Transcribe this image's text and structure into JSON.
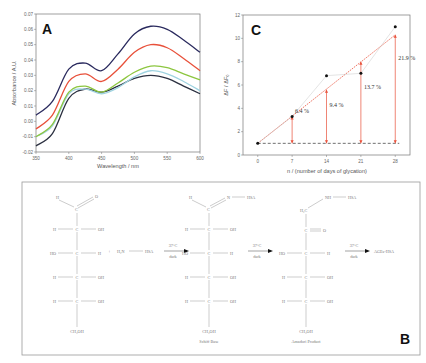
{
  "figure": {
    "panels": [
      "A",
      "B",
      "C"
    ]
  },
  "chart_data": [
    {
      "panel": "A",
      "type": "line",
      "title": "",
      "xlabel": "Wavelength / nm",
      "ylabel": "Absorbance / A.U.",
      "xlim": [
        350,
        600
      ],
      "ylim": [
        -0.02,
        0.07
      ],
      "xticks": [
        "350",
        "400",
        "450",
        "500",
        "550",
        "600"
      ],
      "yticks": [
        "-0.02",
        "-0.01",
        "0.00",
        "0.01",
        "0.02",
        "0.03",
        "0.04",
        "0.05",
        "0.06",
        "0.07"
      ],
      "grid": false,
      "legend": null,
      "x": [
        350,
        375,
        400,
        425,
        450,
        475,
        500,
        525,
        550,
        575,
        600
      ],
      "series": [
        {
          "name": "series-1",
          "color": "#2a2a5e",
          "values": [
            0.004,
            0.013,
            0.034,
            0.038,
            0.033,
            0.044,
            0.057,
            0.062,
            0.06,
            0.053,
            0.045
          ]
        },
        {
          "name": "series-2",
          "color": "#e8503a",
          "values": [
            -0.005,
            0.004,
            0.026,
            0.031,
            0.026,
            0.034,
            0.045,
            0.05,
            0.048,
            0.041,
            0.033
          ]
        },
        {
          "name": "series-3",
          "color": "#8cc63f",
          "values": [
            -0.01,
            -0.002,
            0.019,
            0.023,
            0.019,
            0.025,
            0.032,
            0.036,
            0.035,
            0.031,
            0.027
          ]
        },
        {
          "name": "series-4",
          "color": "#9fd3e0",
          "values": [
            -0.01,
            -0.003,
            0.018,
            0.021,
            0.018,
            0.022,
            0.029,
            0.033,
            0.031,
            0.026,
            0.02
          ]
        },
        {
          "name": "series-5",
          "color": "#2b3040",
          "values": [
            -0.016,
            -0.008,
            0.015,
            0.021,
            0.019,
            0.023,
            0.028,
            0.03,
            0.028,
            0.023,
            0.018
          ]
        }
      ]
    },
    {
      "panel": "C",
      "type": "scatter",
      "title": "",
      "xlabel": "n / (number of days of glycation)",
      "ylabel": "ΔF / ΔF₀",
      "xlim": [
        -3,
        31
      ],
      "ylim": [
        0,
        12
      ],
      "xticks": [
        "0",
        "7",
        "14",
        "21",
        "28"
      ],
      "yticks": [
        "0",
        "2",
        "4",
        "6",
        "8",
        "10",
        "12"
      ],
      "grid": false,
      "legend": null,
      "series": [
        {
          "name": "measured",
          "color": "#111111",
          "x": [
            0,
            7,
            14,
            21,
            28
          ],
          "values": [
            1.0,
            3.3,
            6.8,
            7.0,
            11.0
          ]
        },
        {
          "name": "linear-fit",
          "color": "#e8503a",
          "x": [
            0,
            7,
            14,
            21,
            28
          ],
          "values": [
            1.0,
            3.3,
            5.6,
            8.0,
            10.3
          ]
        },
        {
          "name": "baseline",
          "color": "#333333",
          "x": [
            0,
            28
          ],
          "values": [
            1.0,
            1.0
          ]
        }
      ],
      "annotations": [
        {
          "x": 7,
          "text": "6.4 %"
        },
        {
          "x": 14,
          "text": "9.4 %"
        },
        {
          "x": 21,
          "text": "13.7 %"
        },
        {
          "x": 28,
          "text": "21.9 %"
        }
      ]
    }
  ],
  "scheme_B": {
    "glucose": {
      "top_h": "H",
      "top_o": "O",
      "c": "C",
      "rows": [
        {
          "left": "H",
          "right": "OH"
        },
        {
          "left": "HO",
          "right": "H"
        },
        {
          "left": "H",
          "right": "OH"
        },
        {
          "left": "H",
          "right": "OH"
        }
      ],
      "bottom": "CH₂OH"
    },
    "plus": "+",
    "reagent": {
      "left": "H₂N",
      "right": "HSA"
    },
    "arrow1": {
      "top": "37°C",
      "bottom": "dark"
    },
    "schiff": {
      "top_h": "H",
      "top_n": "N",
      "top_hsa": "HSA",
      "c": "C",
      "rows": [
        {
          "left": "H",
          "right": "OH"
        },
        {
          "left": "HO",
          "right": "H"
        },
        {
          "left": "H",
          "right": "OH"
        },
        {
          "left": "H",
          "right": "OH"
        }
      ],
      "bottom": "CH₂OH",
      "caption": "Schiff Base"
    },
    "arrow2": {
      "top": "37°C",
      "bottom": "dark"
    },
    "amadori": {
      "top_h2c": "H₂C",
      "top_nh": "NH",
      "top_hsa": "HSA",
      "carbonyl_c": "C",
      "carbonyl_o": "O",
      "rows": [
        {
          "left": "HO",
          "right": "H"
        },
        {
          "left": "H",
          "right": "OH"
        },
        {
          "left": "H",
          "right": "OH"
        }
      ],
      "bottom": "CH₂OH",
      "caption": "Amadori Product"
    },
    "arrow3": {
      "top": "37°C",
      "bottom": "dark"
    },
    "product": "AGEs-HSA"
  }
}
